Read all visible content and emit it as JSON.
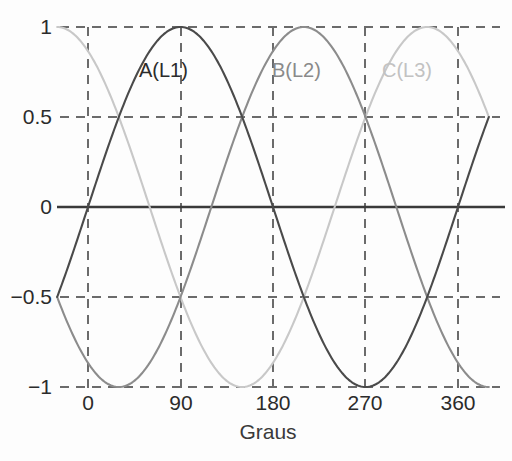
{
  "chart_data": {
    "type": "line",
    "title": "",
    "subtitle": "",
    "xlabel": "Graus",
    "ylabel": "",
    "xlim": [
      -30,
      390
    ],
    "ylim": [
      -1,
      1
    ],
    "grid": true,
    "grid_style": "dashed",
    "legend_position": "inline-annotations",
    "x_ticks": [
      {
        "value": 0,
        "label": "0"
      },
      {
        "value": 90,
        "label": "90"
      },
      {
        "value": 180,
        "label": "180"
      },
      {
        "value": 270,
        "label": "270"
      },
      {
        "value": 360,
        "label": "360"
      }
    ],
    "y_ticks": [
      {
        "value": 1,
        "label": "1"
      },
      {
        "value": 0.5,
        "label": "0.5"
      },
      {
        "value": 0,
        "label": "0"
      },
      {
        "value": -0.5,
        "label": "−0.5"
      },
      {
        "value": -1,
        "label": "−1"
      }
    ],
    "x": [
      -30,
      -20,
      -10,
      0,
      10,
      20,
      30,
      40,
      50,
      60,
      70,
      80,
      90,
      100,
      110,
      120,
      130,
      140,
      150,
      160,
      170,
      180,
      190,
      200,
      210,
      220,
      230,
      240,
      250,
      260,
      270,
      280,
      290,
      300,
      310,
      320,
      330,
      340,
      350,
      360,
      370,
      380,
      390
    ],
    "series": [
      {
        "name": "A(L1)",
        "phase_deg": 0,
        "color": "#4a4a4a",
        "formula": "sin(x)",
        "values": [
          -0.5,
          -0.342,
          -0.174,
          0,
          0.174,
          0.342,
          0.5,
          0.643,
          0.766,
          0.866,
          0.94,
          0.985,
          1,
          0.985,
          0.94,
          0.866,
          0.766,
          0.643,
          0.5,
          0.342,
          0.174,
          0,
          -0.174,
          -0.342,
          -0.5,
          -0.643,
          -0.766,
          -0.866,
          -0.94,
          -0.985,
          -1,
          -0.985,
          -0.94,
          -0.866,
          -0.766,
          -0.643,
          -0.5,
          -0.342,
          -0.174,
          0,
          0.174,
          0.342,
          0.5
        ]
      },
      {
        "name": "B(L2)",
        "phase_deg": -120,
        "color": "#8c8c8c",
        "formula": "sin(x - 120°)",
        "values": [
          0.866,
          0.766,
          0.643,
          0.5,
          0.342,
          0.174,
          0,
          -0.174,
          -0.342,
          -0.5,
          -0.643,
          -0.766,
          -0.866,
          -0.94,
          -0.985,
          -1,
          -0.985,
          -0.94,
          -0.866,
          -0.766,
          -0.643,
          -0.5,
          -0.342,
          -0.174,
          0,
          0.174,
          0.342,
          0.5,
          0.643,
          0.766,
          0.866,
          0.94,
          0.985,
          1,
          0.985,
          0.94,
          0.866,
          0.766,
          0.643,
          0.5,
          0.342,
          0.174,
          0
        ]
      },
      {
        "name": "C(L3)",
        "phase_deg": -240,
        "color": "#c8c8c8",
        "formula": "sin(x - 240°)",
        "values": [
          -0.342,
          -0.5,
          -0.643,
          -0.766,
          -0.866,
          -0.94,
          -0.985,
          -1,
          -0.985,
          -0.94,
          -0.866,
          -0.766,
          -0.643,
          -0.5,
          -0.342,
          -0.174,
          0,
          0.174,
          0.342,
          0.5,
          0.643,
          0.766,
          0.866,
          0.94,
          0.985,
          1,
          0.985,
          0.94,
          0.866,
          0.766,
          0.643,
          0.5,
          0.342,
          0.174,
          0,
          -0.174,
          -0.342,
          -0.5,
          -0.643,
          -0.766,
          -0.866,
          -0.94,
          -0.985
        ]
      }
    ],
    "annotations": [
      {
        "text": "A(L1)",
        "x_deg": 118,
        "y_val": 0.78,
        "color": "#2b2b2b"
      },
      {
        "text": "B(L2)",
        "x_deg": 240,
        "y_val": 0.78,
        "color": "#8a8a8a"
      },
      {
        "text": "C(L3)",
        "x_deg": 352,
        "y_val": 0.78,
        "color": "#c2c2c2"
      }
    ],
    "zero_line": {
      "value": 0,
      "color": "#3a3a3a"
    },
    "grid_color": "#6b6b6b"
  },
  "colors": {
    "background": "#fdfdfd",
    "text": "#2b2b2b",
    "grid": "#6b6b6b",
    "series_a": "#4a4a4a",
    "series_b": "#8c8c8c",
    "series_c": "#c8c8c8"
  }
}
